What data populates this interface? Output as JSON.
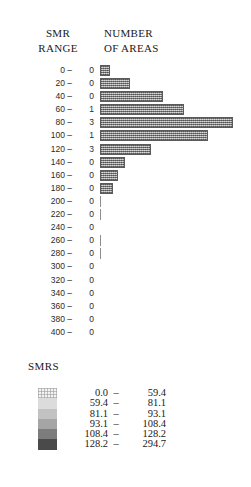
{
  "header": {
    "left_line1": "SMR",
    "left_line2": "RANGE",
    "right_line1": "NUMBER",
    "right_line2": "OF AREAS"
  },
  "legend": {
    "title": "SMRS",
    "entries": [
      {
        "low": "0.0",
        "dash": "–",
        "high": "59.4",
        "color": "#f2f2f2"
      },
      {
        "low": "59.4",
        "dash": "–",
        "high": "81.1",
        "color": "#dcdcdc"
      },
      {
        "low": "81.1",
        "dash": "–",
        "high": "93.1",
        "color": "#c2c2c2"
      },
      {
        "low": "93.1",
        "dash": "–",
        "high": "108.4",
        "color": "#a5a5a5"
      },
      {
        "low": "108.4",
        "dash": "–",
        "high": "128.2",
        "color": "#7c7c7c"
      },
      {
        "low": "128.2",
        "dash": "–",
        "high": "294.7",
        "color": "#4a4a4a"
      }
    ]
  },
  "chart_data": {
    "type": "bar",
    "orientation": "horizontal",
    "title": "",
    "xlabel": "NUMBER OF AREAS",
    "ylabel": "SMR RANGE",
    "grid": false,
    "legend_position": "bottom",
    "categories": [
      "0 –",
      "20 –",
      "40 –",
      "60 –",
      "80 –",
      "100 –",
      "120 –",
      "140 –",
      "160 –",
      "180 –",
      "200 –",
      "220 –",
      "240 –",
      "260 –",
      "280 –",
      "300 –",
      "320 –",
      "340 –",
      "360 –",
      "380 –",
      "400 –"
    ],
    "count_labels": [
      "0",
      "0",
      "0",
      "1",
      "3",
      "1",
      "3",
      "0",
      "0",
      "0",
      "0",
      "0",
      "0",
      "0",
      "0",
      "0",
      "0",
      "0",
      "0",
      "0",
      "0"
    ],
    "values": [
      10,
      30,
      63,
      84,
      133,
      108,
      51,
      25,
      18,
      13,
      1,
      1,
      0,
      1,
      1,
      0,
      0,
      0,
      0,
      0,
      0
    ],
    "xlim": [
      0,
      135
    ]
  }
}
